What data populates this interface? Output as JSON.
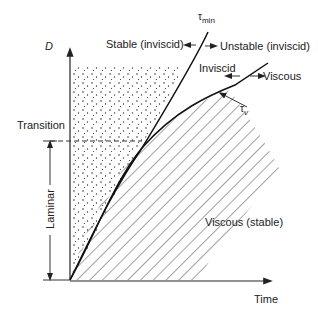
{
  "diagram": {
    "y_axis_label": "D",
    "x_axis_label": "Time",
    "curves": {
      "tau_min": {
        "symbol": "τ",
        "subscript": "min"
      },
      "tau_v": {
        "symbol": "τ",
        "subscript": "v"
      }
    },
    "labels": {
      "stable_inviscid": "Stable (inviscid)",
      "unstable_inviscid": "Unstable (inviscid)",
      "inviscid": "Inviscid",
      "viscous": "Viscous",
      "viscous_stable": "Viscous (stable)",
      "transition": "Transition",
      "laminar": "Laminar"
    },
    "arrows": {
      "left": "←",
      "right": "→"
    }
  }
}
